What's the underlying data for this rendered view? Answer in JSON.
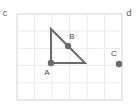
{
  "figure": {
    "background_color": "#ffffff",
    "canvas": {
      "width": 136,
      "height": 112
    }
  },
  "corner_labels": {
    "top_left": "c",
    "top_right": "d"
  },
  "grid": {
    "x": 17,
    "y": 14,
    "width": 105,
    "height": 86,
    "columns": 6,
    "rows": 5,
    "cell_width": 17.5,
    "cell_height": 17.2,
    "line_color": "#e8e8e8",
    "border_color": "#e0e0e0",
    "visible": true
  },
  "shape": {
    "type": "right-triangle",
    "stroke_color": "#6b6b6b",
    "stroke_width": 2,
    "fill": "none",
    "vertices": [
      {
        "name": "apex",
        "x": 51,
        "y": 29
      },
      {
        "name": "A",
        "x": 51,
        "y": 63
      },
      {
        "name": "right-angle-corner",
        "x": 85,
        "y": 63
      }
    ]
  },
  "points": [
    {
      "id": "A",
      "label": "A",
      "x": 51,
      "y": 63,
      "label_x": 47,
      "label_y": 75,
      "radius": 3.2,
      "color": "#6b6b6b"
    },
    {
      "id": "B",
      "label": "B",
      "x": 68,
      "y": 46,
      "label_x": 72,
      "label_y": 39,
      "radius": 3.2,
      "color": "#6b6b6b"
    },
    {
      "id": "C",
      "label": "C",
      "x": 119,
      "y": 64,
      "label_x": 114,
      "label_y": 56,
      "radius": 3.2,
      "color": "#6b6b6b"
    }
  ]
}
